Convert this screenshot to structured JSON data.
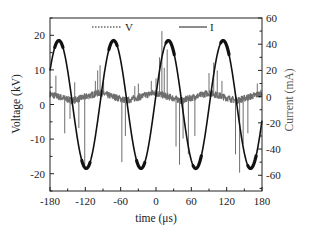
{
  "chart_data": {
    "type": "line",
    "title": "",
    "xlabel": "time (μs)",
    "ylabel": "Voltage (kV)",
    "y2label": "Current (mA)",
    "xlim": [
      -180,
      180
    ],
    "ylim": [
      -25,
      25
    ],
    "y2lim": [
      -72,
      60
    ],
    "x_ticks": [
      -180,
      -120,
      -60,
      0,
      60,
      120,
      180
    ],
    "x_tick_labels": [
      "-180",
      "-120",
      "-60",
      "0",
      "60",
      "120",
      "180"
    ],
    "y_ticks": [
      -20,
      -10,
      0,
      10,
      20
    ],
    "y_tick_labels": [
      "-20",
      "-10",
      "0",
      "10",
      "20"
    ],
    "y2_ticks": [
      -60,
      -40,
      -20,
      0,
      20,
      40,
      60
    ],
    "y2_tick_labels": [
      "-60",
      "-40",
      "-20",
      "0",
      "20",
      "40",
      "60"
    ],
    "grid": false,
    "legend": {
      "position": "top-center",
      "entries": [
        {
          "label": "V",
          "style": "dotted",
          "color": "#1a1a1a"
        },
        {
          "label": "I",
          "style": "solid",
          "color": "#1a1a1a"
        }
      ]
    },
    "series": [
      {
        "name": "Voltage",
        "axis": "left",
        "color": "#111111",
        "shape": "sine",
        "amplitude": 18.5,
        "offset": 0,
        "period": 93,
        "peak_times": [
          -165,
          -73,
          24,
          117
        ],
        "trough_times": [
          -119,
          -26,
          70,
          163
        ],
        "x": [
          -180,
          -165,
          -142,
          -119,
          -96,
          -73,
          -50,
          -26,
          0,
          24,
          47,
          70,
          94,
          117,
          140,
          163,
          180
        ],
        "values": [
          9.5,
          18.5,
          0,
          -18.5,
          0,
          18.5,
          0,
          -18.5,
          0,
          18.5,
          0,
          -18.5,
          0,
          18.5,
          0,
          -18.5,
          -10
        ]
      },
      {
        "name": "Current",
        "axis": "right",
        "color": "#6e6e6e",
        "shape": "noisy triangle with spikes",
        "amplitude": 3,
        "offset": 0,
        "period": 93,
        "x": [
          -180,
          -143,
          -96,
          -50,
          -3,
          44,
          90,
          137,
          180
        ],
        "values": [
          1,
          -3,
          3,
          -3,
          3,
          -3,
          3,
          -3,
          2
        ],
        "spikes": [
          {
            "t": -170,
            "value": 16
          },
          {
            "t": -155,
            "value": -28
          },
          {
            "t": -146,
            "value": -17
          },
          {
            "t": -138,
            "value": 11
          },
          {
            "t": -131,
            "value": -24
          },
          {
            "t": -121,
            "value": -52
          },
          {
            "t": -103,
            "value": 12
          },
          {
            "t": -99,
            "value": 20
          },
          {
            "t": -95,
            "value": 24
          },
          {
            "t": -89,
            "value": 14
          },
          {
            "t": -58,
            "value": -50
          },
          {
            "t": -52,
            "value": -30
          },
          {
            "t": -36,
            "value": 8
          },
          {
            "t": -30,
            "value": 10
          },
          {
            "t": -8,
            "value": 12
          },
          {
            "t": 0,
            "value": 14
          },
          {
            "t": 6,
            "value": 30
          },
          {
            "t": 10,
            "value": 50
          },
          {
            "t": 14,
            "value": 22
          },
          {
            "t": 19,
            "value": 36
          },
          {
            "t": 34,
            "value": -38
          },
          {
            "t": 40,
            "value": -52
          },
          {
            "t": 46,
            "value": -32
          },
          {
            "t": 55,
            "value": -44
          },
          {
            "t": 66,
            "value": -30
          },
          {
            "t": 90,
            "value": 18
          },
          {
            "t": 98,
            "value": 26
          },
          {
            "t": 104,
            "value": 20
          },
          {
            "t": 112,
            "value": 12
          },
          {
            "t": 135,
            "value": -44
          },
          {
            "t": 142,
            "value": -58
          },
          {
            "t": 148,
            "value": -36
          },
          {
            "t": 156,
            "value": -28
          },
          {
            "t": 172,
            "value": 10
          }
        ]
      }
    ]
  },
  "layout": {
    "plot_left": 50,
    "plot_right": 262,
    "plot_top": 18,
    "plot_bottom": 191
  }
}
